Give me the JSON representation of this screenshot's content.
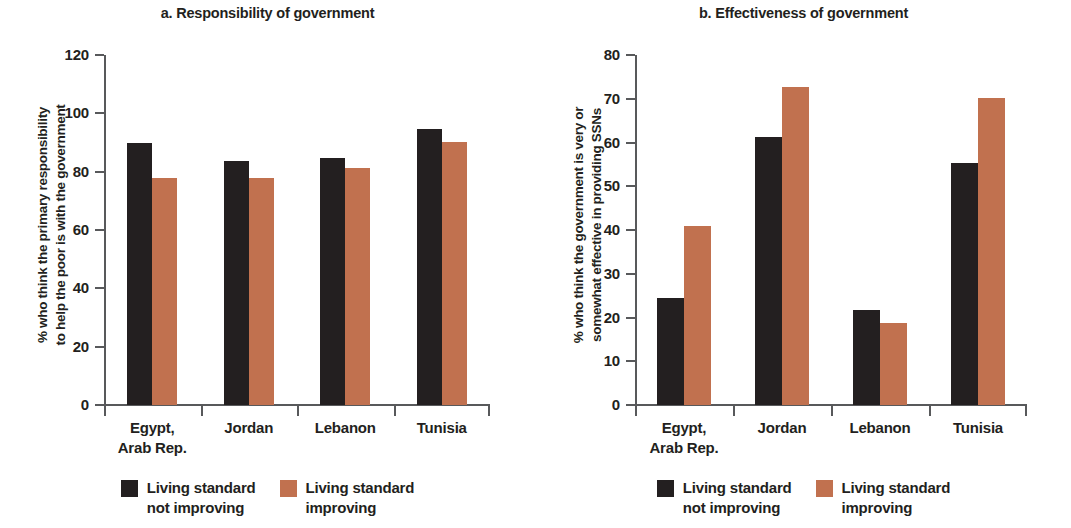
{
  "figure": {
    "width": 1071,
    "height": 528,
    "colors": {
      "series_not_improving": "#231f20",
      "series_improving": "#c1714f",
      "axis": "#58595b",
      "background": "#ffffff"
    }
  },
  "legend": {
    "items": [
      {
        "key": "s0",
        "line1": "Living standard",
        "line2": "not improving",
        "color": "#231f20"
      },
      {
        "key": "s1",
        "line1": "Living standard",
        "line2": "improving",
        "color": "#c1714f"
      }
    ]
  },
  "categories_display": [
    {
      "line1": "Egypt,",
      "line2": "Arab Rep."
    },
    {
      "line1": "Jordan",
      "line2": ""
    },
    {
      "line1": "Lebanon",
      "line2": ""
    },
    {
      "line1": "Tunisia",
      "line2": ""
    }
  ],
  "chart_data": [
    {
      "id": "panel-a",
      "type": "bar",
      "title": "a. Responsibility of government",
      "xlabel": "",
      "ylabel": "% who think the primary responsibility to help the poor is with the government",
      "ylabel_line1": "% who think the primary responsibility",
      "ylabel_line2": "to help the poor is with the government",
      "categories": [
        "Egypt, Arab Rep.",
        "Jordan",
        "Lebanon",
        "Tunisia"
      ],
      "ylim": [
        0,
        120
      ],
      "yticks": [
        0,
        20,
        40,
        60,
        80,
        100,
        120
      ],
      "grid": false,
      "legend_position": "bottom",
      "series": [
        {
          "name": "Living standard not improving",
          "color": "#231f20",
          "values": [
            90.0,
            83.5,
            84.7,
            94.5
          ]
        },
        {
          "name": "Living standard improving",
          "color": "#c1714f",
          "values": [
            78.0,
            78.0,
            81.3,
            90.2
          ]
        }
      ]
    },
    {
      "id": "panel-b",
      "type": "bar",
      "title": "b. Effectiveness of government",
      "xlabel": "",
      "ylabel": "% who think the government is very or somewhat effective in providing SSNs",
      "ylabel_line1": "% who think the government is very or",
      "ylabel_line2": "somewhat effective in providing SSNs",
      "categories": [
        "Egypt, Arab Rep.",
        "Jordan",
        "Lebanon",
        "Tunisia"
      ],
      "ylim": [
        0,
        80
      ],
      "yticks": [
        0,
        10,
        20,
        30,
        40,
        50,
        60,
        70,
        80
      ],
      "grid": false,
      "legend_position": "bottom",
      "series": [
        {
          "name": "Living standard not improving",
          "color": "#231f20",
          "values": [
            24.5,
            61.3,
            21.7,
            55.4
          ]
        },
        {
          "name": "Living standard improving",
          "color": "#c1714f",
          "values": [
            41.0,
            72.6,
            18.8,
            70.2
          ]
        }
      ]
    }
  ]
}
